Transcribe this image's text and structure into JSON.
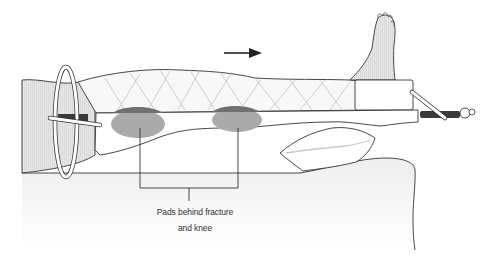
{
  "figure": {
    "caption_line1": "Pads behind fracture",
    "caption_line2": "and knee",
    "arrow_direction": "right",
    "colors": {
      "skin": "#e2e2e2",
      "pad": "#a9a9a9",
      "pad_top": "#707070",
      "rod": "#3a3a3a",
      "outline": "#333333",
      "bandage": "#f7f7f7",
      "surface_shade": "#f2f2f2"
    }
  }
}
